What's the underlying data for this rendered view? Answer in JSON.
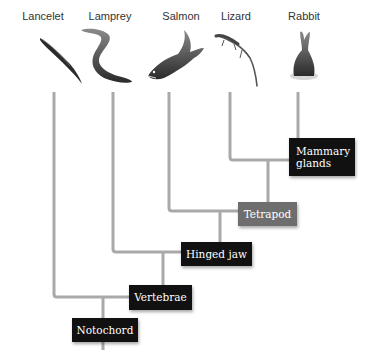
{
  "taxa": [
    {
      "name": "Lancelet",
      "icon": "lancelet-icon"
    },
    {
      "name": "Lamprey",
      "icon": "lamprey-icon"
    },
    {
      "name": "Salmon",
      "icon": "salmon-icon"
    },
    {
      "name": "Lizard",
      "icon": "lizard-icon"
    },
    {
      "name": "Rabbit",
      "icon": "rabbit-icon"
    }
  ],
  "traits": {
    "notochord": "Notochord",
    "vertebrae": "Vertebrae",
    "hinged_jaw": "Hinged jaw",
    "tetrapod": "Tetrapod",
    "mammary_line1": "Mammary",
    "mammary_line2": "glands"
  },
  "colors": {
    "line": "#a9a9a9",
    "box_dark": "#111111",
    "box_tetrapod": "#6e6e6e"
  }
}
